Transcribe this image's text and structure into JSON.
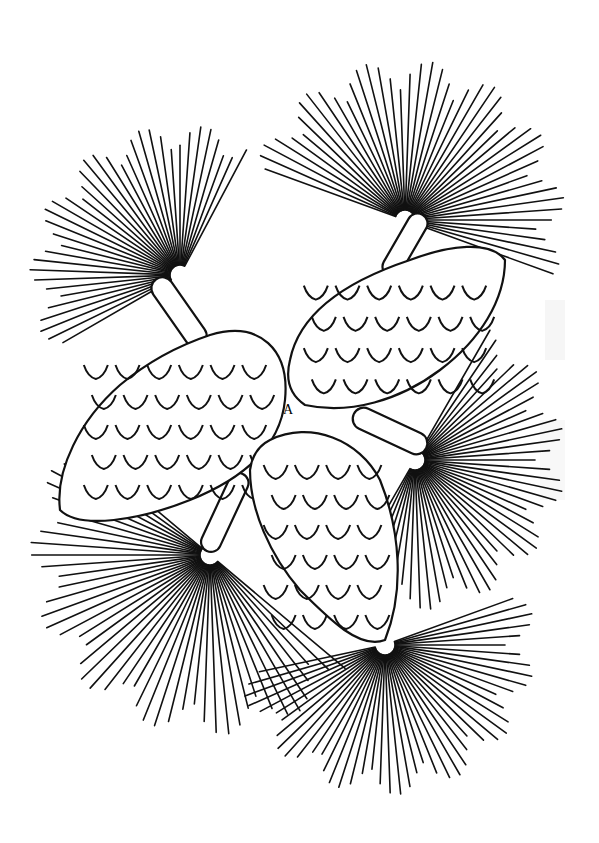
{
  "drawing": {
    "subject": "pine cones with needle clusters",
    "style": "black line art on white",
    "colors": {
      "line": "#111111",
      "background": "#ffffff"
    },
    "clusters": [
      {
        "name": "upper-left",
        "cx": 180,
        "cy": 275,
        "r": 150,
        "a0": 150,
        "a1": 300
      },
      {
        "name": "upper-right",
        "cx": 405,
        "cy": 220,
        "r": 160,
        "a0": 200,
        "a1": 380
      },
      {
        "name": "right",
        "cx": 415,
        "cy": 460,
        "r": 150,
        "a0": -60,
        "a1": 120
      },
      {
        "name": "lower-left",
        "cx": 210,
        "cy": 555,
        "r": 180,
        "a0": 40,
        "a1": 220
      },
      {
        "name": "lower-right",
        "cx": 385,
        "cy": 645,
        "r": 150,
        "a0": -20,
        "a1": 170
      }
    ],
    "signature": "A"
  }
}
